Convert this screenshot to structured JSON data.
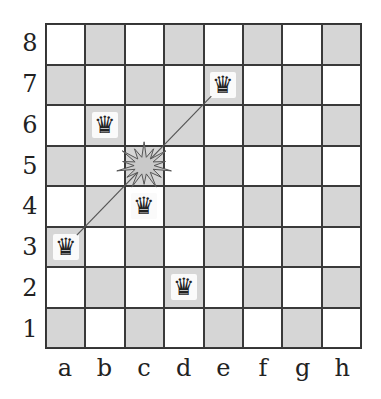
{
  "board": {
    "ranks": [
      "8",
      "7",
      "6",
      "5",
      "4",
      "3",
      "2",
      "1"
    ],
    "files": [
      "a",
      "b",
      "c",
      "d",
      "e",
      "f",
      "g",
      "h"
    ],
    "light_color": "#ffffff",
    "dark_color": "#d6d6d6",
    "queens": [
      {
        "square": "a3",
        "glyph": "♛"
      },
      {
        "square": "b6",
        "glyph": "♛"
      },
      {
        "square": "c4",
        "glyph": "♛"
      },
      {
        "square": "d2",
        "glyph": "♛"
      },
      {
        "square": "e7",
        "glyph": "♛"
      }
    ],
    "attack_line": {
      "from": "a3",
      "to": "e7"
    },
    "conflict_marker": {
      "square": "c5",
      "icon": "explosion-icon"
    }
  }
}
